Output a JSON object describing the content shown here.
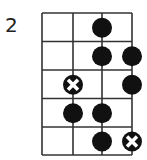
{
  "diagram": {
    "fret_label": "2",
    "strings": 4,
    "frets": 5,
    "colors": {
      "line": "#333333",
      "dot": "#111111",
      "root_fill": "#111111",
      "root_cross": "#ffffff"
    },
    "markers": [
      {
        "fret": 1,
        "string": 3,
        "type": "dot"
      },
      {
        "fret": 2,
        "string": 3,
        "type": "dot"
      },
      {
        "fret": 2,
        "string": 4,
        "type": "dot"
      },
      {
        "fret": 3,
        "string": 2,
        "type": "root"
      },
      {
        "fret": 3,
        "string": 4,
        "type": "dot"
      },
      {
        "fret": 4,
        "string": 2,
        "type": "dot"
      },
      {
        "fret": 4,
        "string": 3,
        "type": "dot"
      },
      {
        "fret": 5,
        "string": 3,
        "type": "dot"
      },
      {
        "fret": 5,
        "string": 4,
        "type": "root"
      }
    ]
  }
}
